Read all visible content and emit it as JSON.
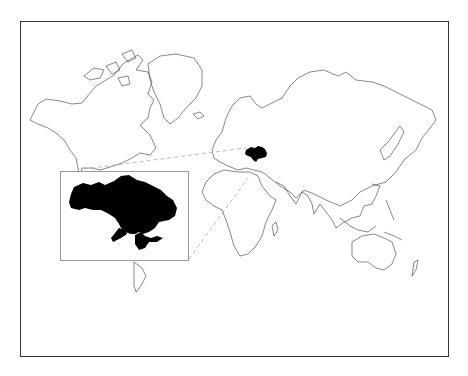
{
  "map": {
    "type": "world-locator-map",
    "projection": "mercator",
    "highlighted_country": "Ukraine",
    "colors": {
      "frame": "#333333",
      "coastline": "#555555",
      "highlight_fill": "#000000",
      "inset_border": "#999999",
      "leader_line": "#aaaaaa",
      "background": "#ffffff"
    },
    "inset": {
      "subject": "Ukraine",
      "shows_crimea": true
    }
  }
}
